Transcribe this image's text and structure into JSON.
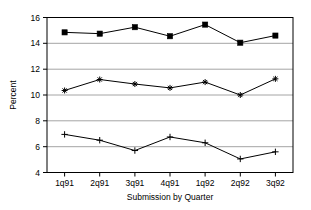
{
  "chart_data": {
    "type": "line",
    "title": "",
    "xlabel": "Submission by Quarter",
    "ylabel": "Percent",
    "categories": [
      "1q91",
      "2q91",
      "3q91",
      "4q91",
      "1q92",
      "2q92",
      "3q92"
    ],
    "ylim": [
      4,
      16
    ],
    "yticks": [
      4,
      6,
      8,
      10,
      12,
      14,
      16
    ],
    "ytick_labels": [
      "4",
      "6",
      "8",
      "10",
      "12",
      "14",
      "16"
    ],
    "grid": true,
    "legend": "none",
    "series": [
      {
        "name": "top-series",
        "marker": "square",
        "values": [
          14.85,
          14.75,
          15.25,
          14.55,
          15.45,
          14.05,
          14.6
        ]
      },
      {
        "name": "middle-series",
        "marker": "star",
        "values": [
          10.35,
          11.2,
          10.85,
          10.55,
          11.0,
          10.0,
          11.25
        ]
      },
      {
        "name": "bottom-series",
        "marker": "plus",
        "values": [
          6.95,
          6.5,
          5.7,
          6.75,
          6.3,
          5.05,
          5.6
        ]
      }
    ]
  },
  "axes": {
    "ylabel": "Percent",
    "xlabel": "Submission by Quarter",
    "ytick_0": "4",
    "ytick_1": "6",
    "ytick_2": "8",
    "ytick_3": "10",
    "ytick_4": "12",
    "ytick_5": "14",
    "ytick_6": "16",
    "xtick_0": "1q91",
    "xtick_1": "2q91",
    "xtick_2": "3q91",
    "xtick_3": "4q91",
    "xtick_4": "1q92",
    "xtick_5": "2q92",
    "xtick_6": "3q92"
  },
  "colors": {
    "line": "#000000",
    "grid": "#9a9a9a",
    "frame": "#000000",
    "background": "#ffffff"
  }
}
